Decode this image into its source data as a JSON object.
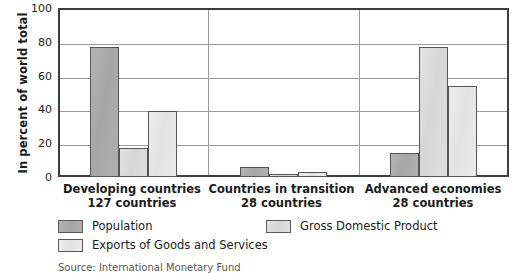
{
  "chart_data": {
    "type": "bar",
    "title": "",
    "xlabel": "",
    "ylabel": "In percent of world total",
    "ylim": [
      0,
      100
    ],
    "yticks": [
      100,
      80,
      60,
      40,
      20,
      0
    ],
    "grid": true,
    "legend_position": "bottom",
    "categories": [
      "Developing countries",
      "Countries in transition",
      "Advanced economies"
    ],
    "category_sublabels": [
      "127 countries",
      "28 countries",
      "28 countries"
    ],
    "series": [
      {
        "name": "Population",
        "color": "#a8a8a8",
        "values": [
          77,
          6,
          14
        ]
      },
      {
        "name": "Gross Domestic Product",
        "color": "#d8d8d8",
        "values": [
          17,
          2,
          77
        ]
      },
      {
        "name": "Exports of Goods and Services",
        "color": "#e8e8e8",
        "values": [
          39,
          3,
          54
        ]
      }
    ],
    "source": "Source: International Monetary Fund"
  },
  "axis": {
    "y_title": "In percent of world total",
    "y_tick_100": "100",
    "y_tick_80": "80",
    "y_tick_60": "60",
    "y_tick_40": "40",
    "y_tick_20": "20",
    "y_tick_0": "0"
  },
  "categories": [
    {
      "name": "Developing countries",
      "sub": "127 countries"
    },
    {
      "name": "Countries in transition",
      "sub": "28 countries"
    },
    {
      "name": "Advanced economies",
      "sub": "28 countries"
    }
  ],
  "legend": {
    "population": "Population",
    "gdp": "Gross Domestic Product",
    "exports": "Exports of Goods and Services"
  },
  "footer": {
    "source": "Source: International Monetary Fund"
  }
}
